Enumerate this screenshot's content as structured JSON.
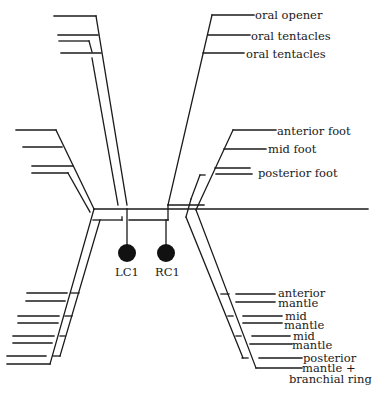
{
  "diagram": {
    "type": "nerve-connectivity-diagram",
    "colors": {
      "line": "#1a1a1a",
      "node": "#111111",
      "background": "#ffffff"
    },
    "nodes": [
      {
        "id": "lc1",
        "label": "LC1"
      },
      {
        "id": "rc1",
        "label": "RC1"
      }
    ],
    "labels": {
      "oral_opener": "oral opener",
      "oral_tentacles_1": "oral tentacles",
      "oral_tentacles_2": "oral tentacles",
      "anterior_foot": "anterior foot",
      "mid_foot": "mid foot",
      "posterior_foot": "posterior foot",
      "anterior_mantle_1": "anterior",
      "anterior_mantle_2": "mantle",
      "mid_mantle_a1": "mid",
      "mid_mantle_a2": "mantle",
      "mid_mantle_b1": "mid",
      "mid_mantle_b2": "mantle",
      "posterior_mantle_1": "posterior",
      "posterior_mantle_2": "mantle +",
      "posterior_mantle_3": "branchial ring"
    }
  }
}
